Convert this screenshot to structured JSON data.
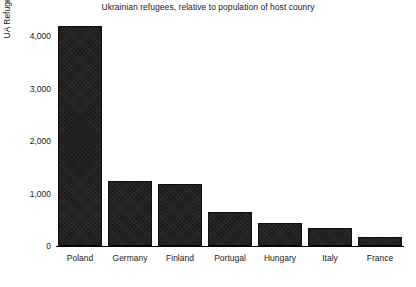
{
  "chart_data": {
    "type": "bar",
    "title": "Ukrainian refugees, relative to population of host counry",
    "xlabel": "",
    "ylabel": "UA Refugees Asylum/TPD applications per 100k",
    "categories": [
      "Poland",
      "Germany",
      "Finland",
      "Portugal",
      "Hungary",
      "Italy",
      "France"
    ],
    "values": [
      4190,
      1240,
      1180,
      650,
      440,
      350,
      170
    ],
    "series": [
      {
        "name": "UA Refugees Asylum/TPD applications per 100k",
        "values": [
          4190,
          1240,
          1180,
          650,
          440,
          350,
          170
        ]
      }
    ],
    "ylim": [
      0,
      4300
    ],
    "yticks": [
      0,
      1000,
      2000,
      3000,
      4000
    ],
    "ytick_labels": [
      "0",
      "1,000",
      "2,000",
      "3,000",
      "4,000"
    ],
    "grid": false,
    "legend": false,
    "bar_color": "#1c1c1c",
    "background_color": "#ffffff",
    "text_color": "#1a1a1a"
  }
}
